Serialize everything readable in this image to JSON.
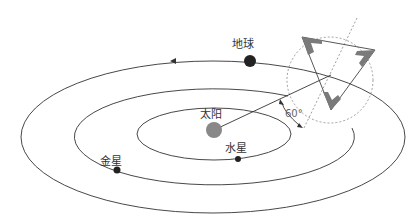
{
  "diagram": {
    "bodies": {
      "sun": "太阳",
      "earth": "地球",
      "mercury": "水星",
      "venus": "金星"
    },
    "angle_label": "60°",
    "colors": {
      "orbit": "#333333",
      "sun": "#888888",
      "planet": "#222222",
      "triangle": "#7a7a7a",
      "dashed": "#888888"
    }
  }
}
